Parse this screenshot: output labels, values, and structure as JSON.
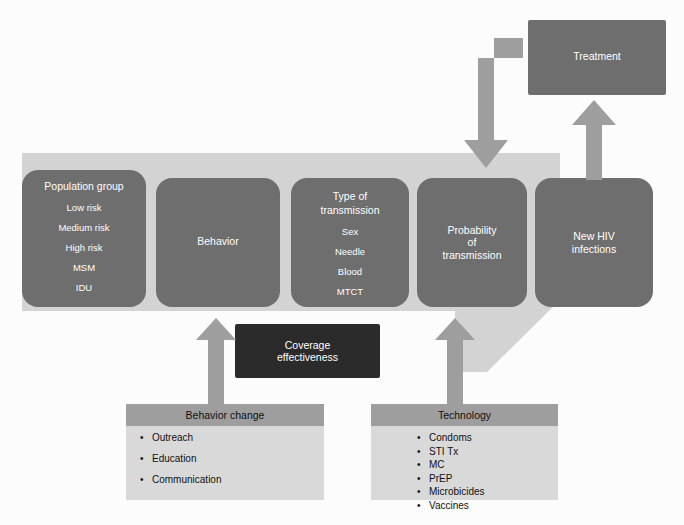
{
  "diagram": {
    "colors": {
      "node_fill": "#6e6e6e",
      "node_dark_fill": "#2b2b2b",
      "band_fill": "#d3d3d3",
      "arrow_fill": "#9e9e9e",
      "panel_body": "#d9d9d9",
      "panel_head": "#9e9e9e",
      "background": "#fcfcfc",
      "node_text": "#ffffff",
      "panel_text": "#111111"
    },
    "nodes": {
      "population_group": {
        "title": "Population group",
        "items": [
          "Low risk",
          "Medium risk",
          "High risk",
          "MSM",
          "IDU"
        ]
      },
      "behavior": {
        "title": "Behavior"
      },
      "type_of_transmission": {
        "title_line1": "Type of",
        "title_line2": "transmission",
        "items": [
          "Sex",
          "Needle",
          "Blood",
          "MTCT"
        ]
      },
      "probability_of_transmission": {
        "line1": "Probability",
        "line2": "of",
        "line3": "transmission"
      },
      "new_hiv_infections": {
        "line1": "New HIV",
        "line2": "infections"
      },
      "treatment": {
        "title": "Treatment"
      },
      "coverage_effectiveness": {
        "line1": "Coverage",
        "line2": "effectiveness"
      }
    },
    "panels": {
      "behavior_change": {
        "header": "Behavior change",
        "items": [
          "Outreach",
          "Education",
          "Communication"
        ]
      },
      "technology": {
        "header": "Technology",
        "items": [
          "Condoms",
          "STI Tx",
          "MC",
          "PrEP",
          "Microbicides",
          "Vaccines"
        ]
      }
    },
    "arrows": {
      "behavior_change_to_behavior": "up-arrow",
      "technology_to_probability": "up-arrow",
      "new_infections_to_treatment": "up-arrow",
      "treatment_to_population": "elbow-down-arrow",
      "flow_band": "population-to-new-infections-band"
    },
    "caption": ""
  }
}
